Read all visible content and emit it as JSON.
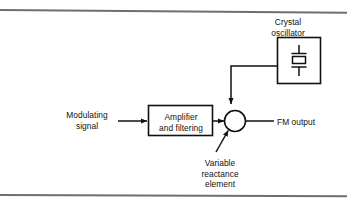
{
  "figure": {
    "type": "block-diagram",
    "line_color": "#111111",
    "rule_color": "#6e6e6e",
    "background": "#ffffff"
  },
  "blocks": [
    {
      "id": "crystal-oscillator",
      "label": "Crystal\noscillator",
      "label_line1": "Crystal",
      "label_line2": "oscillator",
      "label_position": "above",
      "symbol": "crystal-symbol",
      "x": 277,
      "y": 37,
      "w": 44,
      "h": 47
    },
    {
      "id": "amplifier-and-filtering",
      "label": "Amplifier\nand filtering",
      "label_line1": "Amplifier",
      "label_line2": "and filtering",
      "label_position": "inside",
      "x": 148,
      "y": 105,
      "w": 65,
      "h": 31
    },
    {
      "id": "summing-junction",
      "label": "",
      "shape": "circle",
      "cx": 235,
      "cy": 121,
      "r": 11
    }
  ],
  "labels": {
    "crystal_oscillator": "Crystal\noscillator",
    "modulating_signal": "Modulating\nsignal",
    "amplifier_and_filtering": "Amplifier\nand filtering",
    "fm_output": "FM output",
    "variable_reactance_element": "Variable\nreactance\nelement"
  },
  "connections": [
    {
      "id": "modulating-to-amplifier",
      "from": "Modulating signal",
      "to": "Amplifier and filtering",
      "arrow": true,
      "direction": "right"
    },
    {
      "id": "amplifier-to-junction",
      "from": "Amplifier and filtering",
      "to": "summing junction",
      "arrow": true,
      "direction": "right"
    },
    {
      "id": "crystal-to-junction",
      "from": "Crystal oscillator",
      "to": "summing junction",
      "arrow": true,
      "direction": "down"
    },
    {
      "id": "junction-to-fmoutput",
      "from": "summing junction",
      "to": "FM output",
      "arrow": false,
      "direction": "right"
    },
    {
      "id": "variable-reactance-pointer",
      "from": "Variable reactance element",
      "to": "summing junction",
      "arrow": true,
      "direction": "up-right"
    }
  ]
}
